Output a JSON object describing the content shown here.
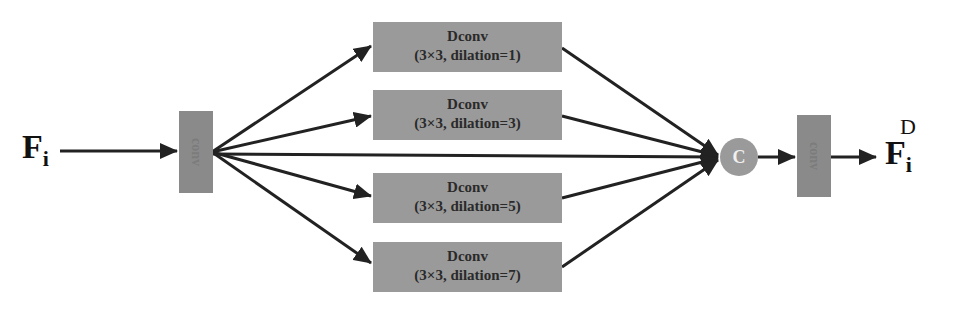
{
  "diagram": {
    "input_label": {
      "base": "F",
      "sub": "i"
    },
    "output_label": {
      "base": "F",
      "sub": "i",
      "sup": "D"
    },
    "input_conv": {
      "label": "conv"
    },
    "output_conv": {
      "label": "conv"
    },
    "branches": [
      {
        "title": "Dconv",
        "params": "(3×3, dilation=1)"
      },
      {
        "title": "Dconv",
        "params": "(3×3, dilation=3)"
      },
      {
        "title": "Dconv",
        "params": "(3×3, dilation=5)"
      },
      {
        "title": "Dconv",
        "params": "(3×3, dilation=7)"
      }
    ],
    "concat": {
      "symbol": "C"
    },
    "colors": {
      "block": "#9a9a9a",
      "conv": "#8a8a8a",
      "arrow": "#222222"
    }
  }
}
